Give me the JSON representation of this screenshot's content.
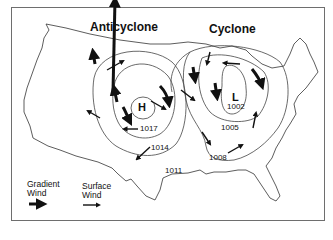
{
  "diagram": {
    "titles": {
      "anticyclone": "Anticyclone",
      "cyclone": "Cyclone"
    },
    "pressure_centers": {
      "high": {
        "symbol": "H",
        "label": "high-pressure-center"
      },
      "low": {
        "symbol": "L",
        "label": "low-pressure-center"
      }
    },
    "isobars": {
      "i1017": "1017",
      "i1014": "1014",
      "i1011": "1011",
      "i1008": "1008",
      "i1005": "1005",
      "i1002": "1002"
    },
    "legend": {
      "gradient_wind_line1": "Gradient",
      "gradient_wind_line2": "Wind",
      "surface_wind_line1": "Surface",
      "surface_wind_line2": "Wind"
    },
    "colors": {
      "ink": "#111111",
      "isobar": "#444444",
      "frame": "#6e6e6e",
      "background": "#ffffff"
    }
  }
}
